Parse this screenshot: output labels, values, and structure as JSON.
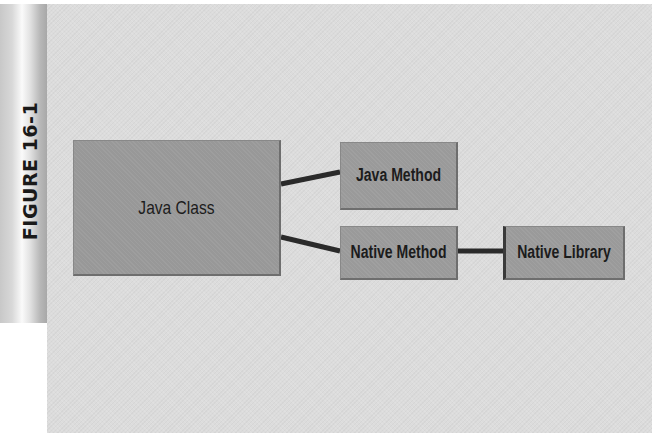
{
  "figure": {
    "label": "FIGURE 16-1"
  },
  "nodes": {
    "java_class": "Java Class",
    "java_method": "Java Method",
    "native_method": "Native Method",
    "native_library": "Native Library"
  },
  "edges": [
    {
      "from": "Java Class",
      "to": "Java Method"
    },
    {
      "from": "Java Class",
      "to": "Native Method"
    },
    {
      "from": "Native Method",
      "to": "Native Library"
    }
  ],
  "colors": {
    "panel_background": "#dcdcdc",
    "node_fill": "#9a9a9a",
    "connector": "#2a2a2a",
    "text": "#1c1c1c"
  }
}
